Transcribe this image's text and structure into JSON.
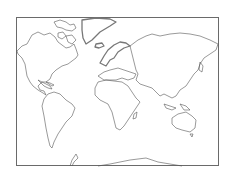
{
  "map": {
    "type": "world-outline",
    "projection": "mercator",
    "labels": [],
    "colors": {
      "frame": "#6a6a6a",
      "coastline": "#555555",
      "background": "#ffffff"
    },
    "regions": [
      "north-america",
      "greenland",
      "south-america",
      "europe",
      "africa",
      "asia",
      "australia",
      "antarctica"
    ]
  }
}
